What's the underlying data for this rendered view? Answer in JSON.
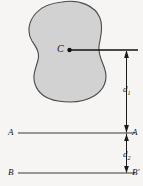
{
  "figure": {
    "background_color": "#f6f5f3",
    "body": {
      "name": "irregular plane body",
      "fill_color": "#d2d2d2",
      "stroke_color": "#4a4a4a"
    },
    "centroid": {
      "label": "C",
      "dot_color": "#111111",
      "x": 70,
      "y": 50
    },
    "dimensions": [
      {
        "label": "d",
        "subscript": "1",
        "from": "centroidal axis",
        "to": "axis A-A"
      },
      {
        "label": "d",
        "subscript": "2",
        "from": "axis A-A",
        "to": "axis B-B"
      }
    ],
    "axes": [
      {
        "name": "axis-a",
        "left_label": "A",
        "right_label": "A",
        "right_prime": "",
        "y": 133,
        "color": "#3a3a3a"
      },
      {
        "name": "axis-b",
        "left_label": "B",
        "right_label": "B",
        "right_prime": "′",
        "y": 173,
        "color": "#3a3a3a"
      }
    ],
    "leader_line": {
      "name": "centroid-leader",
      "color": "#111111"
    }
  }
}
